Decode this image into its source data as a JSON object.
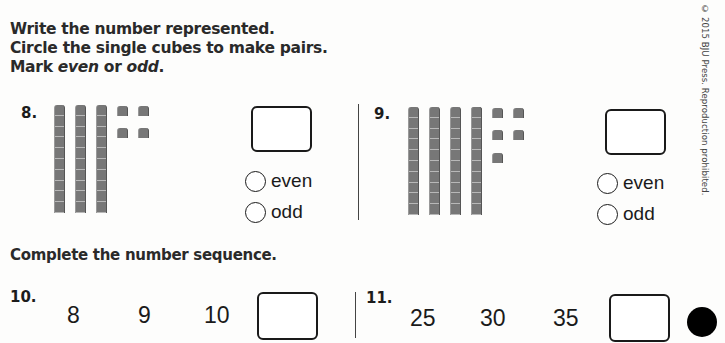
{
  "instructions": {
    "line1": "Write the number represented.",
    "line2": "Circle the single cubes to make pairs.",
    "line3_prefix": "Mark ",
    "line3_even": "even",
    "line3_or": " or ",
    "line3_odd": "odd",
    "line3_suffix": "."
  },
  "copyright": "© 2015 BJU Press. Reproduction prohibited.",
  "problems": [
    {
      "number": "8.",
      "tens_rods": 3,
      "single_cubes": 4,
      "answer": "",
      "options": [
        "even",
        "odd"
      ]
    },
    {
      "number": "9.",
      "tens_rods": 4,
      "single_cubes": 5,
      "answer": "",
      "options": [
        "even",
        "odd"
      ]
    }
  ],
  "sequence_section": {
    "title": "Complete the number sequence.",
    "items": [
      {
        "number": "10.",
        "values": [
          "8",
          "9",
          "10"
        ],
        "answer": ""
      },
      {
        "number": "11.",
        "values": [
          "25",
          "30",
          "35"
        ],
        "answer": ""
      }
    ]
  }
}
